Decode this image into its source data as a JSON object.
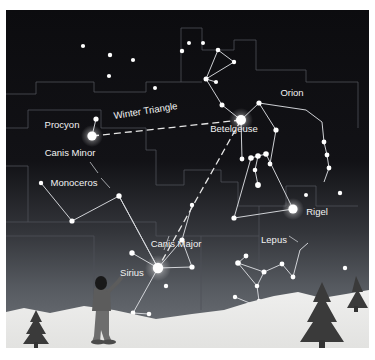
{
  "figure": {
    "kind": "star-chart",
    "title_visible": false,
    "frame": {
      "x": 6,
      "y": 10,
      "width": 363,
      "height": 338,
      "background": "#0d0d10",
      "page_background": "#ffffff"
    }
  },
  "colors": {
    "sky_top": "#0d0d10",
    "sky_horizon": "#6e7277",
    "ground_snow": "#e8e8e6",
    "star": "#ffffff",
    "constellation_line": "#d8dade",
    "boundary_line": "#4e5258",
    "dashed_asterism": "#e6e6e6",
    "label_text": "#f2f2f2",
    "tree": "#3c3c3c",
    "observer": "#5a5a5a"
  },
  "labels": [
    {
      "id": "procyon",
      "text": "Procyon",
      "x": 56,
      "y": 118,
      "rotation": 0,
      "anchor": "middle",
      "size": "normal"
    },
    {
      "id": "winter-triangle",
      "text": "Winter Triangle",
      "x": 140,
      "y": 104,
      "rotation": -9,
      "anchor": "middle",
      "size": "wt"
    },
    {
      "id": "betelgeuse",
      "text": "Betelgeuse",
      "x": 228,
      "y": 122,
      "rotation": 0,
      "anchor": "middle",
      "size": "normal"
    },
    {
      "id": "orion",
      "text": "Orion",
      "x": 286,
      "y": 86,
      "rotation": 0,
      "anchor": "middle",
      "size": "normal"
    },
    {
      "id": "canis-minor",
      "text": "Canis Minor",
      "x": 64,
      "y": 146,
      "rotation": 0,
      "anchor": "middle",
      "size": "normal"
    },
    {
      "id": "monoceros",
      "text": "Monoceros",
      "x": 68,
      "y": 176,
      "rotation": 0,
      "anchor": "middle",
      "size": "normal"
    },
    {
      "id": "rigel",
      "text": "Rigel",
      "x": 311,
      "y": 205,
      "rotation": 0,
      "anchor": "middle",
      "size": "normal"
    },
    {
      "id": "canis-major",
      "text": "Canis Major",
      "x": 170,
      "y": 237,
      "rotation": 0,
      "anchor": "middle",
      "size": "normal"
    },
    {
      "id": "lepus",
      "text": "Lepus",
      "x": 268,
      "y": 233,
      "rotation": 0,
      "anchor": "middle",
      "size": "normal"
    },
    {
      "id": "sirius",
      "text": "Sirius",
      "x": 126,
      "y": 266,
      "rotation": 0,
      "anchor": "middle",
      "size": "normal"
    }
  ],
  "named_stars": [
    {
      "name": "Procyon",
      "x": 86,
      "y": 126,
      "radius": 4.6,
      "constellation": "Canis Minor"
    },
    {
      "name": "Betelgeuse",
      "x": 235,
      "y": 110,
      "radius": 5.0,
      "constellation": "Orion"
    },
    {
      "name": "Rigel",
      "x": 287,
      "y": 199,
      "radius": 4.6,
      "constellation": "Orion"
    },
    {
      "name": "Sirius",
      "x": 152,
      "y": 258,
      "radius": 5.2,
      "constellation": "Canis Major"
    }
  ],
  "stars": [
    {
      "x": 77,
      "y": 36,
      "r": 2.1
    },
    {
      "x": 104,
      "y": 45,
      "r": 2.2
    },
    {
      "x": 127,
      "y": 50,
      "r": 2.1
    },
    {
      "x": 176,
      "y": 41,
      "r": 2.2
    },
    {
      "x": 103,
      "y": 66,
      "r": 2.1
    },
    {
      "x": 149,
      "y": 78,
      "r": 2.0
    },
    {
      "x": 183,
      "y": 33,
      "r": 2.0
    },
    {
      "x": 197,
      "y": 33,
      "r": 2.0
    },
    {
      "x": 212,
      "y": 40,
      "r": 2.3
    },
    {
      "x": 228,
      "y": 52,
      "r": 2.2
    },
    {
      "x": 200,
      "y": 68,
      "r": 2.5
    },
    {
      "x": 210,
      "y": 72,
      "r": 2.1
    },
    {
      "x": 200,
      "y": 70,
      "r": 2.2
    },
    {
      "x": 216,
      "y": 95,
      "r": 2.5
    },
    {
      "x": 253,
      "y": 93,
      "r": 2.6
    },
    {
      "x": 270,
      "y": 120,
      "r": 2.6
    },
    {
      "x": 245,
      "y": 148,
      "r": 2.8
    },
    {
      "x": 252,
      "y": 146,
      "r": 2.8
    },
    {
      "x": 260,
      "y": 144,
      "r": 2.8
    },
    {
      "x": 249,
      "y": 160,
      "r": 2.3
    },
    {
      "x": 252,
      "y": 175,
      "r": 2.9
    },
    {
      "x": 264,
      "y": 154,
      "r": 2.4
    },
    {
      "x": 236,
      "y": 149,
      "r": 2.4
    },
    {
      "x": 239,
      "y": 161,
      "r": 2.1
    },
    {
      "x": 228,
      "y": 208,
      "r": 2.6
    },
    {
      "x": 318,
      "y": 132,
      "r": 2.4
    },
    {
      "x": 321,
      "y": 145,
      "r": 2.4
    },
    {
      "x": 323,
      "y": 158,
      "r": 2.4
    },
    {
      "x": 334,
      "y": 183,
      "r": 2.2
    },
    {
      "x": 300,
      "y": 185,
      "r": 2.0
    },
    {
      "x": 90,
      "y": 109,
      "r": 2.6
    },
    {
      "x": 35,
      "y": 173,
      "r": 2.2
    },
    {
      "x": 66,
      "y": 211,
      "r": 2.6
    },
    {
      "x": 113,
      "y": 186,
      "r": 2.7
    },
    {
      "x": 126,
      "y": 243,
      "r": 2.7
    },
    {
      "x": 176,
      "y": 230,
      "r": 2.6
    },
    {
      "x": 186,
      "y": 257,
      "r": 2.6
    },
    {
      "x": 160,
      "y": 276,
      "r": 2.2
    },
    {
      "x": 127,
      "y": 303,
      "r": 2.4
    },
    {
      "x": 143,
      "y": 304,
      "r": 2.3
    },
    {
      "x": 240,
      "y": 246,
      "r": 2.4
    },
    {
      "x": 232,
      "y": 253,
      "r": 2.8
    },
    {
      "x": 258,
      "y": 262,
      "r": 2.5
    },
    {
      "x": 251,
      "y": 276,
      "r": 2.3
    },
    {
      "x": 253,
      "y": 291,
      "r": 2.2
    },
    {
      "x": 276,
      "y": 254,
      "r": 2.4
    },
    {
      "x": 287,
      "y": 267,
      "r": 2.4
    },
    {
      "x": 229,
      "y": 287,
      "r": 2.2
    },
    {
      "x": 339,
      "y": 258,
      "r": 2.2
    }
  ],
  "asterism": {
    "name": "Winter Triangle",
    "vertices": [
      "Procyon",
      "Betelgeuse",
      "Sirius"
    ],
    "style": "dashed"
  },
  "constellations": [
    {
      "name": "Orion",
      "label_id": "orion"
    },
    {
      "name": "Canis Major",
      "label_id": "canis-major"
    },
    {
      "name": "Canis Minor",
      "label_id": "canis-minor"
    },
    {
      "name": "Monoceros",
      "label_id": "monoceros"
    },
    {
      "name": "Lepus",
      "label_id": "lepus"
    }
  ],
  "scene": {
    "observer": {
      "present": true,
      "x": 94,
      "y": 310,
      "description": "person-figure"
    },
    "trees": [
      {
        "x": 30,
        "y": 330,
        "height": 28
      },
      {
        "x": 316,
        "y": 308,
        "height": 46
      },
      {
        "x": 349,
        "y": 300,
        "height": 32
      }
    ],
    "horizon": {
      "present": true,
      "snow": true
    }
  }
}
